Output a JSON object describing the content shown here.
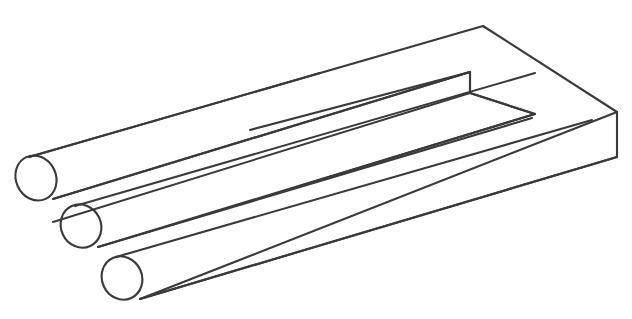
{
  "figure": {
    "name": "impossible-trident",
    "alt_names": [
      "Devil's Fork",
      "Blivet",
      "Poiuyt",
      "Impossible Fork"
    ],
    "background_color": "#ffffff",
    "line_color": "#3a3a3a",
    "line_width": 2.1,
    "canvas": {
      "width": 632,
      "height": 319
    },
    "style": "monochrome technical line art, no fill, no shading, no labels"
  },
  "geometry": {
    "projection": "oblique / isometric-like, axis direction up-right",
    "axis_slope_dy_dx": -0.478,
    "prongs": [
      {
        "id": "prong-top",
        "label": "upper cylindrical prong",
        "ellipse": {
          "cx": 36,
          "cy": 178,
          "rx": 20,
          "ry": 23,
          "rotation": -25
        },
        "top_line": {
          "x1": 29,
          "y1": 157,
          "x2": 483,
          "y2": 26
        },
        "bottom_line": {
          "x1": 53,
          "y1": 199,
          "x2": 466,
          "y2": 76
        }
      },
      {
        "id": "prong-middle",
        "label": "middle cylindrical prong",
        "ellipse": {
          "cx": 81,
          "cy": 226,
          "rx": 20,
          "ry": 22,
          "rotation": -25
        },
        "top_line": {
          "x1": 75,
          "y1": 206,
          "x2": 535,
          "y2": 73
        },
        "bottom_line": {
          "x1": 98,
          "y1": 247,
          "x2": 532,
          "y2": 118
        }
      },
      {
        "id": "prong-bottom",
        "label": "lower cylindrical prong",
        "ellipse": {
          "cx": 122,
          "cy": 278,
          "rx": 20,
          "ry": 22,
          "rotation": -25
        },
        "top_line": {
          "x1": 116,
          "y1": 257,
          "x2": 592,
          "y2": 120
        },
        "bottom_line": {
          "x1": 140,
          "y1": 299,
          "x2": 617,
          "y2": 157
        }
      }
    ],
    "slab": {
      "id": "rectangular-slab",
      "label": "flat rectangular block with U-shaped slot",
      "top_face_corners": [
        {
          "x": 29,
          "y": 157,
          "name": "top-face-left"
        },
        {
          "x": 483,
          "y": 26,
          "name": "top-face-far"
        },
        {
          "x": 617,
          "y": 112,
          "name": "top-face-right"
        },
        {
          "x": 140,
          "y": 299,
          "name": "top-face-near"
        }
      ],
      "right_edge": {
        "x1": 617,
        "y1": 112,
        "x2": 617,
        "y2": 157
      },
      "slot": {
        "label": "U-shaped notch cut into slab",
        "outer_corner": {
          "x": 470,
          "y": 72
        },
        "inner_drop": {
          "x": 470,
          "y": 93
        },
        "inner_corner": {
          "x": 535,
          "y": 114
        }
      }
    }
  },
  "illusion": {
    "type": "impossible-object",
    "ambiguity": "Three round prongs at the left terminate as only two flat rectangular prongs at the right; the middle prong's outline resolves into the slot of the block.",
    "visible_text": null
  }
}
